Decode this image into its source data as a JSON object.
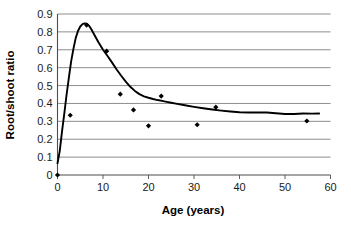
{
  "chart_data": {
    "type": "line",
    "title": "",
    "xlabel": "Age (years)",
    "ylabel": "Root/shoot ratio",
    "xlim": [
      0,
      60
    ],
    "ylim": [
      0,
      0.9
    ],
    "xticks": [
      "0",
      "10",
      "20",
      "30",
      "40",
      "50",
      "60"
    ],
    "xtick_values": [
      0,
      10,
      20,
      30,
      40,
      50,
      60
    ],
    "yticks": [
      "0",
      "0.1",
      "0.2",
      "0.3",
      "0.4",
      "0.5",
      "0.6",
      "0.7",
      "0.8",
      "0.9"
    ],
    "ytick_values": [
      0,
      0.1,
      0.2,
      0.3,
      0.4,
      0.5,
      0.6,
      0.7,
      0.8,
      0.9
    ],
    "grid": "horizontal",
    "legend": "none",
    "series": [
      {
        "name": "model curve",
        "kind": "line",
        "color": "#000000",
        "x": [
          0.0,
          0.5,
          1.0,
          1.5,
          2.0,
          2.5,
          3.0,
          3.5,
          4.0,
          4.5,
          5.0,
          5.5,
          6.0,
          6.5,
          7.0,
          7.5,
          8.0,
          9.0,
          10.0,
          11.0,
          12.0,
          13.0,
          14.0,
          15.0,
          16.0,
          17.0,
          18.0,
          19.0,
          20.0,
          21.0,
          22.0,
          23.0,
          24.0,
          25.0,
          26.0,
          28.0,
          30.0,
          32.0,
          34.0,
          36.0,
          38.0,
          40.0,
          42.0,
          44.0,
          46.0,
          48.0,
          50.0,
          52.0,
          54.0,
          56.0,
          57.5
        ],
        "y": [
          0.065,
          0.135,
          0.245,
          0.345,
          0.45,
          0.545,
          0.635,
          0.705,
          0.765,
          0.805,
          0.83,
          0.843,
          0.848,
          0.845,
          0.832,
          0.812,
          0.788,
          0.742,
          0.7,
          0.665,
          0.628,
          0.59,
          0.555,
          0.522,
          0.493,
          0.47,
          0.452,
          0.44,
          0.432,
          0.425,
          0.419,
          0.414,
          0.409,
          0.404,
          0.399,
          0.39,
          0.381,
          0.373,
          0.366,
          0.36,
          0.355,
          0.351,
          0.349,
          0.35,
          0.349,
          0.345,
          0.341,
          0.341,
          0.344,
          0.343,
          0.344
        ]
      },
      {
        "name": "observations",
        "kind": "scatter",
        "color": "#000000",
        "marker": "diamond",
        "points": [
          {
            "x": 0.0,
            "y": 0.0
          },
          {
            "x": 2.8,
            "y": 0.334
          },
          {
            "x": 6.4,
            "y": 0.838
          },
          {
            "x": 10.8,
            "y": 0.692
          },
          {
            "x": 13.8,
            "y": 0.452
          },
          {
            "x": 16.7,
            "y": 0.364
          },
          {
            "x": 20.0,
            "y": 0.275
          },
          {
            "x": 22.8,
            "y": 0.441
          },
          {
            "x": 30.7,
            "y": 0.281
          },
          {
            "x": 34.8,
            "y": 0.379
          },
          {
            "x": 54.8,
            "y": 0.302
          }
        ]
      }
    ]
  }
}
